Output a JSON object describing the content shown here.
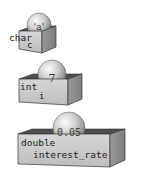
{
  "variables": [
    {
      "type": "char",
      "name": "c",
      "value": "'a'"
    },
    {
      "type": "int",
      "name": "i",
      "value": "7"
    },
    {
      "type": "double",
      "name": "interest_rate",
      "value": "0.05"
    }
  ],
  "colors": {
    "box_front": "#c8c8c8",
    "box_side": "#8e8e8e",
    "box_top_inner": "#5a5a5a",
    "sphere_light": "#f4f4f4",
    "sphere_dark": "#7a7a7a",
    "stroke": "#333333"
  }
}
